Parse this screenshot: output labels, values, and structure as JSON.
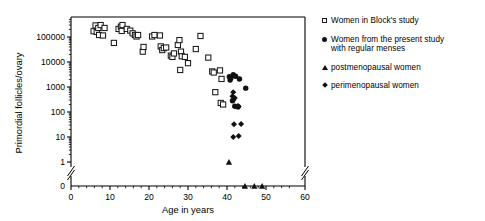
{
  "chart_data": {
    "type": "scatter",
    "title": "",
    "xlabel": "Age in years",
    "ylabel": "Primordial follicles/ovary",
    "xlim": [
      0,
      60
    ],
    "xticks": [
      0,
      10,
      20,
      30,
      40,
      50,
      60
    ],
    "xtick_labels": [
      "0",
      "10",
      "20",
      "30",
      "40",
      "50",
      "60"
    ],
    "x_axis_break_before": 60,
    "yscale": "log",
    "ylim": [
      1,
      400000
    ],
    "yticks": [
      1,
      10,
      100,
      1000,
      10000,
      100000
    ],
    "ytick_labels": [
      "1",
      "10",
      "100",
      "1000",
      "10000",
      "100000"
    ],
    "y_zero_label": "0",
    "y_axis_break_between": [
      0,
      1
    ],
    "grid": false,
    "legend_position": "right",
    "series": [
      {
        "name": "Women in Block's study",
        "marker": "open-square",
        "color": "#1a1a1a",
        "points": [
          [
            5.8,
            170000
          ],
          [
            6.3,
            290000
          ],
          [
            6.6,
            160000
          ],
          [
            7.0,
            230000
          ],
          [
            7.2,
            120000
          ],
          [
            7.6,
            300000
          ],
          [
            8.2,
            115000
          ],
          [
            8.6,
            230000
          ],
          [
            11.0,
            58000
          ],
          [
            12.2,
            210000
          ],
          [
            12.8,
            260000
          ],
          [
            13.2,
            300000
          ],
          [
            13.0,
            175000
          ],
          [
            14.3,
            210000
          ],
          [
            15.2,
            180000
          ],
          [
            15.8,
            140000
          ],
          [
            16.4,
            120000
          ],
          [
            16.8,
            105000
          ],
          [
            17.2,
            120000
          ],
          [
            18.4,
            26000
          ],
          [
            18.6,
            40000
          ],
          [
            20.8,
            105000
          ],
          [
            21.4,
            120000
          ],
          [
            22.8,
            115000
          ],
          [
            23.0,
            42000
          ],
          [
            23.4,
            30000
          ],
          [
            23.8,
            36000
          ],
          [
            24.4,
            38000
          ],
          [
            25.6,
            18000
          ],
          [
            26.0,
            16000
          ],
          [
            26.4,
            22000
          ],
          [
            27.4,
            48000
          ],
          [
            27.8,
            75000
          ],
          [
            28.2,
            26000
          ],
          [
            28.4,
            17000
          ],
          [
            28.0,
            4800
          ],
          [
            29.2,
            16000
          ],
          [
            30.0,
            9000
          ],
          [
            32.0,
            33000
          ],
          [
            33.2,
            110000
          ],
          [
            35.2,
            15000
          ],
          [
            36.2,
            4200
          ],
          [
            36.6,
            3800
          ],
          [
            37.0,
            620
          ],
          [
            38.2,
            4600
          ],
          [
            38.6,
            2100
          ],
          [
            38.4,
            230
          ],
          [
            39.0,
            200
          ]
        ]
      },
      {
        "name": "Women from the present study\nwith regular menses",
        "marker": "filled-circle",
        "color": "#111111",
        "points": [
          [
            40.6,
            2600
          ],
          [
            40.8,
            1900
          ],
          [
            41.0,
            2300
          ],
          [
            41.6,
            3100
          ],
          [
            42.2,
            2700
          ],
          [
            43.2,
            2100
          ],
          [
            44.8,
            900
          ],
          [
            41.4,
            280
          ],
          [
            42.0,
            170
          ],
          [
            42.8,
            160
          ]
        ]
      },
      {
        "name": "postmenopausal women",
        "marker": "filled-triangle",
        "color": "#111111",
        "points": [
          [
            40.5,
            1.0
          ],
          [
            44.6,
            0
          ],
          [
            47.0,
            0
          ],
          [
            49.0,
            0
          ]
        ]
      },
      {
        "name": "perimenopausal women",
        "marker": "filled-diamond",
        "color": "#111111",
        "points": [
          [
            41.6,
            620
          ],
          [
            41.4,
            430
          ],
          [
            41.6,
            300
          ],
          [
            42.0,
            360
          ],
          [
            42.8,
            175
          ],
          [
            43.0,
            165
          ],
          [
            41.8,
            32
          ],
          [
            43.6,
            33
          ],
          [
            41.6,
            10
          ],
          [
            43.0,
            11
          ]
        ]
      }
    ]
  },
  "legend": {
    "items": [
      {
        "marker": "open-square",
        "label": "Women in Block's study"
      },
      {
        "marker": "filled-circle",
        "label": "Women from the present study\nwith regular menses"
      },
      {
        "marker": "filled-triangle",
        "label": "postmenopausal women"
      },
      {
        "marker": "filled-diamond",
        "label": "perimenopausal women"
      }
    ]
  }
}
